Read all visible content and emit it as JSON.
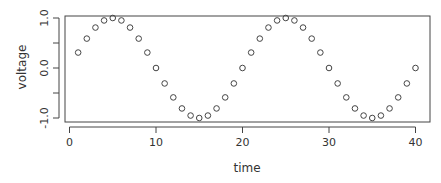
{
  "chart_data": {
    "type": "scatter",
    "title": "",
    "xlabel": "time",
    "ylabel": "voltage",
    "xlim": [
      0,
      40
    ],
    "ylim": [
      -1.0,
      1.0
    ],
    "x_ticks": [
      0,
      10,
      20,
      30,
      40
    ],
    "x_tick_labels": [
      "0",
      "10",
      "20",
      "30",
      "40"
    ],
    "y_ticks": [
      -1.0,
      -0.5,
      0.0,
      0.5,
      1.0
    ],
    "y_tick_labels": [
      "-1.0",
      "",
      "0.0",
      "",
      "1.0"
    ],
    "grid": false,
    "legend": null,
    "marker": "open-circle",
    "marker_color": "#444444",
    "series": [
      {
        "name": "voltage",
        "x": [
          1,
          2,
          3,
          4,
          5,
          6,
          7,
          8,
          9,
          10,
          11,
          12,
          13,
          14,
          15,
          16,
          17,
          18,
          19,
          20,
          21,
          22,
          23,
          24,
          25,
          26,
          27,
          28,
          29,
          30,
          31,
          32,
          33,
          34,
          35,
          36,
          37,
          38,
          39,
          40
        ],
        "y": [
          0.309,
          0.588,
          0.809,
          0.951,
          1.0,
          0.951,
          0.809,
          0.588,
          0.309,
          0.0,
          -0.309,
          -0.588,
          -0.809,
          -0.951,
          -1.0,
          -0.951,
          -0.809,
          -0.588,
          -0.309,
          0.0,
          0.309,
          0.588,
          0.809,
          0.951,
          1.0,
          0.951,
          0.809,
          0.588,
          0.309,
          0.0,
          -0.309,
          -0.588,
          -0.809,
          -0.951,
          -1.0,
          -0.951,
          -0.809,
          -0.588,
          -0.309,
          0.0
        ]
      }
    ]
  }
}
